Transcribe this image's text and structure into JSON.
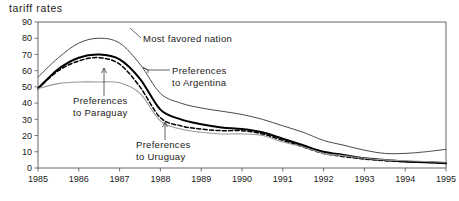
{
  "chart_data": {
    "type": "line",
    "title": "tariff rates",
    "xlabel": "",
    "ylabel": "",
    "xlim": [
      1985,
      1995
    ],
    "ylim": [
      0,
      90
    ],
    "grid": false,
    "legend_position": "inline-annotations",
    "x_ticks": [
      "1985",
      "1986",
      "1987",
      "1988",
      "1989",
      "1990",
      "1991",
      "1992",
      "1993",
      "1994",
      "1995"
    ],
    "y_ticks": [
      "0",
      "10",
      "20",
      "30",
      "40",
      "50",
      "60",
      "70",
      "80",
      "90"
    ],
    "x": [
      1985,
      1985.5,
      1986,
      1986.5,
      1987,
      1987.5,
      1988,
      1988.5,
      1989,
      1989.5,
      1990,
      1990.5,
      1991,
      1991.5,
      1992,
      1992.5,
      1993,
      1993.5,
      1994,
      1994.5,
      1995
    ],
    "series": [
      {
        "name": "Most favored nation",
        "color": "#4a4a4a",
        "style": "solid-thin",
        "values": [
          56,
          68,
          77,
          80,
          77,
          64,
          46,
          40,
          37,
          35,
          33,
          30,
          26,
          22,
          17,
          14,
          11,
          9,
          9,
          10,
          11.5
        ]
      },
      {
        "name": "Preferences to Argentina",
        "color": "#000000",
        "style": "solid-thick",
        "values": [
          49,
          61,
          68,
          70,
          67,
          55,
          36,
          30,
          27,
          25,
          24,
          22,
          18,
          14,
          10,
          8,
          6,
          5,
          4,
          3.5,
          3
        ]
      },
      {
        "name": "Preferences to Uruguay",
        "color": "#000000",
        "style": "dashed",
        "values": [
          49,
          60,
          66,
          68,
          64,
          50,
          31,
          26,
          24,
          23,
          23,
          21,
          17,
          13,
          9,
          7,
          5.5,
          4.5,
          4,
          3.5,
          3
        ]
      },
      {
        "name": "Preferences to Paraguay",
        "color": "#9a9a9a",
        "style": "solid-light",
        "values": [
          49,
          52,
          53,
          53,
          52.5,
          46,
          29,
          24,
          22,
          21,
          21,
          20,
          16,
          13,
          9,
          7.5,
          6,
          5,
          4.5,
          4,
          3.5
        ]
      }
    ],
    "annotations": [
      {
        "id": "mfn",
        "line1": "Most favored nation",
        "line2": "",
        "text_x": 143,
        "text_y": 42,
        "anchor": "start",
        "pointer": "diagonal-left"
      },
      {
        "id": "argentina",
        "line1": "Preferences",
        "line2": "to Argentina",
        "text_x": 172,
        "text_y": 74,
        "anchor": "start",
        "pointer": "left-arrow"
      },
      {
        "id": "paraguay",
        "line1": "Preferences",
        "line2": "to Paraguay",
        "text_x": 73,
        "text_y": 104,
        "anchor": "start",
        "pointer": "up-arrow"
      },
      {
        "id": "uruguay",
        "line1": "Preferences",
        "line2": "to Uruguay",
        "text_x": 136,
        "text_y": 148,
        "anchor": "start",
        "pointer": "up-arrow"
      }
    ]
  }
}
